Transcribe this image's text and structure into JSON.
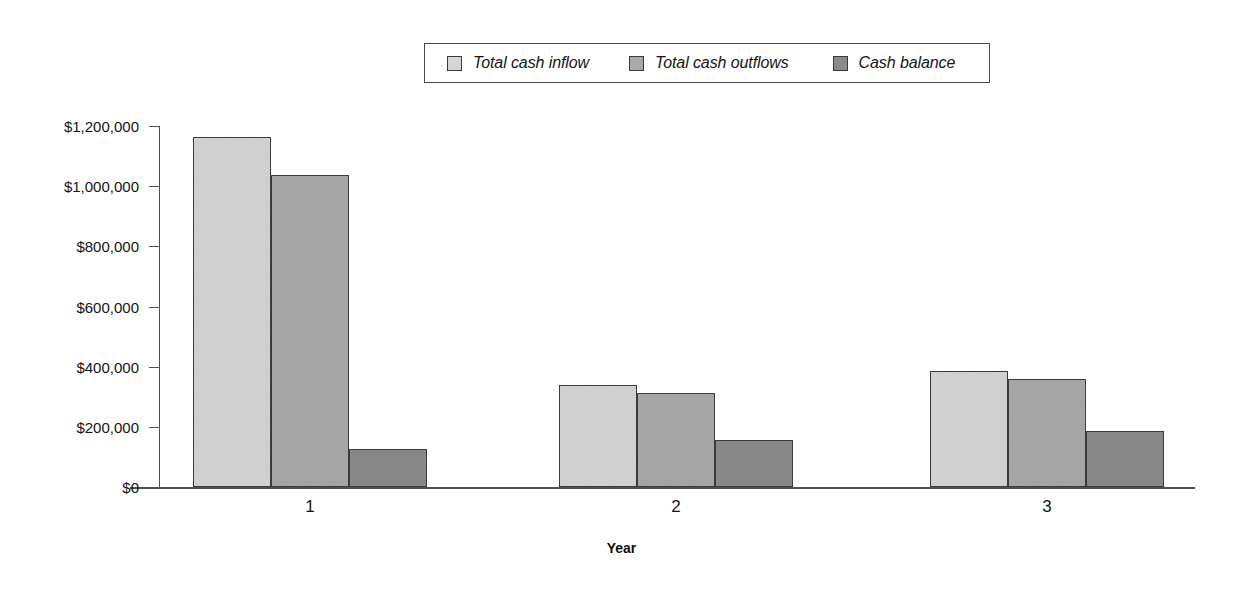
{
  "chart_data": {
    "type": "bar",
    "title": "",
    "subtitle": "",
    "xlabel": "Year",
    "ylabel": "",
    "categories": [
      "1",
      "2",
      "3"
    ],
    "series": [
      {
        "name": "Total cash inflow",
        "color": "#d5d5d5",
        "values": [
          1163000,
          339000,
          386000
        ]
      },
      {
        "name": "Total cash outflows",
        "color": "#a9a9a9",
        "values": [
          1037000,
          312000,
          359000
        ]
      },
      {
        "name": "Cash balance",
        "color": "#8b8b8b",
        "values": [
          126000,
          156000,
          186000
        ]
      }
    ],
    "ylim": [
      0,
      1200000
    ],
    "ytick_values": [
      0,
      200000,
      400000,
      600000,
      800000,
      1000000,
      1200000
    ],
    "ytick_labels": [
      "$0",
      "$200,000",
      "$400,000",
      "$600,000",
      "$800,000",
      "$1,000,000",
      "$1,200,000"
    ],
    "grid": false,
    "legend_position": "top-center",
    "legend_entries": [
      "Total cash inflow",
      "Total cash outflows",
      "Cash balance"
    ]
  },
  "legend": {
    "items": [
      {
        "label": "Total cash inflow"
      },
      {
        "label": "Total cash outflows"
      },
      {
        "label": "Cash balance"
      }
    ]
  },
  "axes": {
    "x_title": "Year",
    "x_labels": [
      "1",
      "2",
      "3"
    ],
    "y_labels": [
      "$1,200,000",
      "$1,000,000",
      "$800,000",
      "$600,000",
      "$400,000",
      "$200,000",
      "$0"
    ]
  }
}
